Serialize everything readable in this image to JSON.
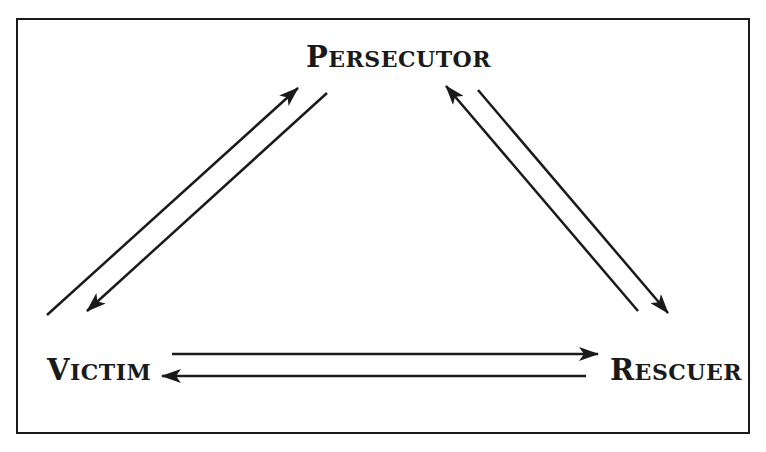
{
  "diagram": {
    "nodes": {
      "persecutor": {
        "first": "P",
        "rest": "ERSECUTOR",
        "full": "Persecutor"
      },
      "victim": {
        "first": "V",
        "rest": "ICTIM",
        "full": "Victim"
      },
      "rescuer": {
        "first": "R",
        "rest": "ESCUER",
        "full": "Rescuer"
      }
    },
    "edges": [
      {
        "from": "Victim",
        "to": "Persecutor"
      },
      {
        "from": "Persecutor",
        "to": "Victim"
      },
      {
        "from": "Rescuer",
        "to": "Persecutor"
      },
      {
        "from": "Persecutor",
        "to": "Rescuer"
      },
      {
        "from": "Victim",
        "to": "Rescuer"
      },
      {
        "from": "Rescuer",
        "to": "Victim"
      }
    ],
    "colors": {
      "stroke": "#1a1a1a",
      "background": "#ffffff"
    }
  }
}
